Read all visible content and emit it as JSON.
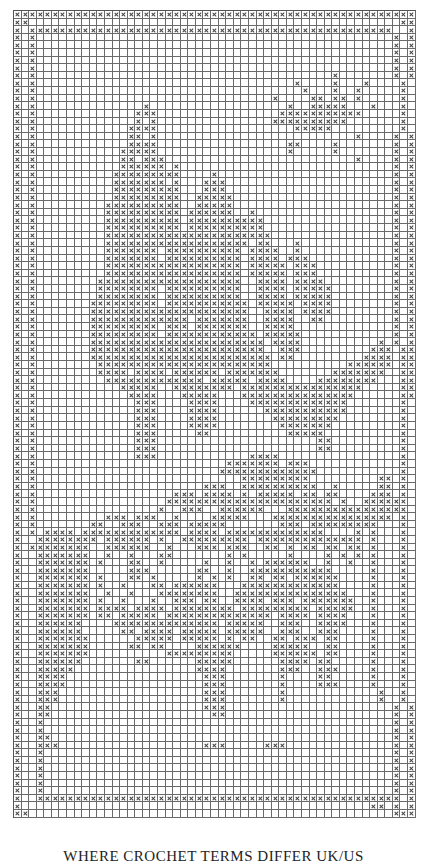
{
  "chart_title": "",
  "caption": "WHERE CROCHET TERMS DIFFER UK/US",
  "legend": {
    "filled_symbol": "x",
    "empty_symbol": "."
  },
  "grid": {
    "columns": 53,
    "rows": 108,
    "colors": {
      "line": "#6a6a6a",
      "mark": "#444444",
      "background": "#ffffff"
    },
    "pattern": [
      "xxxxxxxxxxxxxxxxxxxxxxxxxxxxxxxxxxxxxxxxxxxxxxxxxxxxx",
      "xx.................................................xx",
      "x.xxxxxxxxxxxxxxxxxxxxxxxxxxxxxxxxxxxxxxxxxxxxxxxx..x",
      "x.x...............................................x.x",
      "x.x...............................................x.x",
      "x.x...............................................x.x",
      "x.x...............................................x.x",
      "x.x...............................................x.x",
      "x.x.......................................x.......x.x",
      "x.x..................................x....x...x....x.x",
      "x.x...................................x...x..x.....x.x",
      "x.x...............................x....xx.xx.x.....x.x",
      "x.x..............x..................x..xxxxx...x...x.x",
      "x.x.............xxx................xxxxxxxxxxx.....x.x",
      "x.x.............x.x...............xxxxxxxxxx.......x.x",
      "x.x............xxxx..................xxxxx.........x.x",
      "x.x............xx.x..........................x....x.x",
      "x.x............xxxx.................xx....x.......x.x",
      "x.x...........xxxxx.................x.....x.......x.x",
      "x.x...........xx.xxx.........................x....x.x",
      "x.x...........xxxxxx.x............................x.x",
      "x.x..........xxxxxxxxx....x.......................x.x",
      "x.x..........xxxxxxx.x...xxx......................x.x",
      "x.x..........xxxxxxxxx...xxx......................x.x",
      "x.x..........xxxxxxxxx..xxxxx.....................x.x",
      "x.x.........xxxxxxxxxx..xxxxx.....................x.x",
      "x.x.........xxxxxxxxxx.xxxxxx..x..................x.x",
      "x.x.........xxxxxxxxxx.xxxxxxxxxx.................x.x",
      "x.x.........xxxxxxxxxx.xxxxxxxxxx.................x.x",
      "x.x.........xxxxxxxxxxxxxxxxxxxxxx................x.x",
      "x.x.........xxxxxxxxxxxxxxxxxxx.xx...x............x.x",
      "x.x.........xxxxxxx.xxxxxxxxxx.xxxx..x............x.x",
      "x.x.........xxxxxxx.xxxxxxxxxx.xxxx.xxx...........x.x",
      "x.x.........xxxxxxxxxxxxxxxxxx.xxxxx.xxx..........x.x",
      "x.x.........xxxxxxxxxxxxxxxxxx.xxxxx.xxx..........x.x",
      "x.x........xxxxxxxxxxxxxxxxxxx..xxxx.xxxx.........x.x",
      "x.x........xxxxxxxx.xxxxxxxxxx..xxxx.xxxxx........x.x",
      "x.x........xxxxxxxx.xxxxxxxxxx..xxxx.xxxxx........x.x",
      "x.x.......xxxxxxxxx.xxxxxxxxxxx.xxxxx.xxxx........x.x",
      "x.x.......xxxxxxxxxxxxxxxxxxxxx..xxxx.xxxx........x.x",
      "x.x.......xxxxxxxxxxxxx.xxxxxxx..xxxx..xx.........x.x",
      "x.x.......xxxxxxxxx.xxx.xxxxxxx..xxxx.............x.x",
      "x.x.......xxxxxxxxx.xxxxxxxxxxxx.xxxxx............x.x",
      "x.x.......xxxxxxxxxxxxxxxxxxxxxxx.xxxx..........x.x.x",
      "x.x.......xxxxxxxxxxxxxxxxxxxxxxx..xxx.........xxx.xx",
      "x.x.......xxxxxxxxxxxxxxxxxxxxxxxx.xx.........xxxx.xx",
      "x.x........xxxxxxxxxxxxxxxxxxxxxxx..........xxxxxx.xx",
      "x.x........xxxx.xxxx.xxxxxx.xxxxxxx.......xxxxxxx..xx",
      "x.x.........xxxxxxxxxxxxx.xxxxx.xxxx....xxxxxxxx...xx",
      "x.x...........xxxxx..xxxxxxxx.xxxxxxxxxxxxxxxx.....xx",
      "x.x............xxxx...xxxxx...xxxxxxxxxxxxxxx......xx",
      "x.x.............xxx....xxxx....xxxxxxxxxxxxx.......x.x",
      "x.x.............xxx....xxxx......xxxxxxxxxxx.......x.x",
      "x.x.............xxx....xxxx.......xxxxxxxxx........x.x",
      "x.x.............xxx....xxxx........xxxxxxx.........x.x",
      "x.x.............xxx.....xx..........xxxxx..........x.x",
      "x.x.............xxx.....................xx.........x.x",
      "x.x.............xxx.....................xx.........x.x",
      "x.x.............xxx............xxxx................x.x",
      "x.x.........................xxxxxxx.xxx............x.x",
      "x.x........................xxxxxxxxxxxxx...........x.x",
      "x.x...........................xxxxxxxxx.........xx.x.x",
      "x.x......................xxx..xxxxxxxxxx..x.....xx.x.x",
      "x.x..................xxx.xxxx.x.xxxxx.xx.xx....xxx.x.x",
      "x.x.................xxxxxxxxxxxxxxxxxxxxxx.x..xxxxxx.x",
      "x.x................x..xxx..xxxxxx...xxxxxxxxxxxxxxxx.x",
      "x.x.........xxx.xxx..x....xxxxx...xxxxxxxxxxxxxxxx.x.x",
      "x.x.......xx..xxx..xxx.xxxxx.......xxx.xxxxxxxxx...x.x",
      "x.x.xxxx.xxxxxxxxxxxxx.xxxx.xxxxxxxxxxxxx....x.x...x.x",
      "x..xxxxxxxx.xxxxxx.x..xxxxxxxxx.xxxxxxxxxxxxxx.x...x.x",
      "x.xxxxxxxx..xxxxxx..x...xxx.xxx..xx.x.xx.xx.xx.x...x.x",
      "x..xxxxxxx..x..x...xx.......x.x.....x....x.x.x.x...x.x",
      "x..xxxxxxx.x...xx..x.....x..x..x.xxxxxx..x..x..x...x.x",
      "x..xxxxxxx.....xxx......xx..x..xxxxxxxxxxx.....x...x.x",
      "x..xxxxxxx.x...xx.x.....x.x.x..xx.xx.xxxxxx....x...x.x",
      "x..xxxxxxx.x..x...xx.xxxxxx...xxxxxxxxxxxxx....x...x.x",
      "x..xxxxxxx..x..x...xxxxxxxx..xxxxxxxxxxxxxxx...x...x.x",
      "x..xxxxxxx.x..x...x..xxx.xx..xxxx.xxx.xxxxxxx..x...x.x",
      "x..xxxxxxx.xxxx.xxxx.xxxxxxxx.xxxxxxxxx.xxxxx..x...x.x",
      "x..xxxxxxx.xx.xxxxx.xxxxxxxxxxxxxx.xxxx.xxxx...x...x.x",
      "x..xxxxxx....xxxxxxxxxxxxxx.xxxxx..xxx..xxxx...x...x.x",
      "x..xxxxxx.....xx.xxxx.xxxxx.xxxxx..xxx..xxx....x...x.x",
      "x..xxxxxxx......xxxxx.xxxxx.x.xx..xx.xxx.xx....x...x.x",
      "x..xxxxxxx.....xx.xx....xxxxxx....xxxxx..xx....x...x.x",
      "x..xxxxxxx..........xxxxxxxxx.....xxxxxx.xx....x...x.x",
      "x..xxxxxx.......xx......xxxxx......xxxx.xx.....x...x.x",
      "x..xxxxx................xxxx.......xxx..xxx....x...x.x",
      "x..xxxx..................xxx.......x....xx.....x...x.x",
      "x..xxxx..................xxx.......x....xxx....x...x.x",
      "x..xxx...................xxx.......x............x..x.x",
      "x..xxx...................xxx.......x............x..x.x",
      "x..xx....................xxx......................x.x",
      "x..xx.....................xx......................x.x",
      "x..x..............................................x.x",
      "x..x..............................................x.x",
      "x..xx.............................................x.x",
      "x..xxx...................xxx.....xxx..............x.x",
      "x..x..............................................x.x",
      "x..x..............................................x.x",
      "x..x..............................................x.x",
      "x..x..............................................x.x",
      "x..x..............................................x.x",
      "x..x..............................................x.x",
      "x..xxxxxxxxxxxxxxxxxxxxxxxxxxxxxxxxxxxxxxxxxxxxxxxx.x",
      "x..............................................xx.x.x",
      "xx................................................xxx",
      "xxxxxxxxxxxxxxxxxxxxxxxxxxxxxxxxxxxxxxxxxxxxxxxxxxxxx",
      ".....................................................",
      "....................................................."
    ]
  }
}
